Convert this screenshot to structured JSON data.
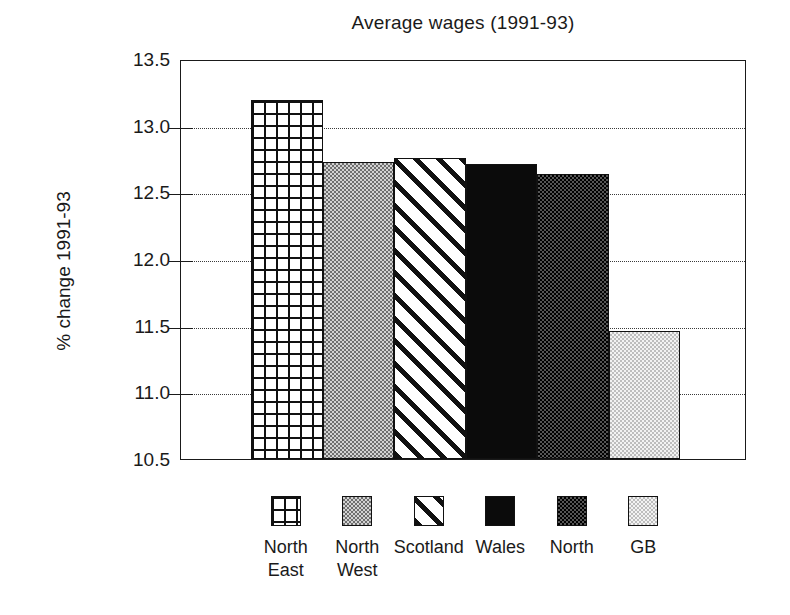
{
  "chart_data": {
    "type": "bar",
    "title": "Average wages (1991-93)",
    "xlabel": "",
    "ylabel": "% change 1991-93",
    "categories": [
      "North East",
      "North West",
      "Scotland",
      "Wales",
      "North",
      "GB"
    ],
    "category_lines": [
      [
        "North",
        "East"
      ],
      [
        "North",
        "West"
      ],
      [
        "Scotland"
      ],
      [
        "Wales"
      ],
      [
        "North"
      ],
      [
        "GB"
      ]
    ],
    "values": [
      13.19,
      12.73,
      12.76,
      12.71,
      12.64,
      11.46
    ],
    "ylim": [
      10.5,
      13.5
    ],
    "ytick_labels": [
      "13.5",
      "13.0",
      "12.5",
      "12.0",
      "11.5",
      "11.0",
      "10.5"
    ],
    "ytick_values": [
      13.5,
      13.0,
      12.5,
      12.0,
      11.5,
      11.0,
      10.5
    ],
    "grid": true,
    "grid_style": "dotted-horizontal",
    "legend_position": "bottom",
    "series_patterns": [
      "grid",
      "dots-medium",
      "diagonal-hatch",
      "solid-black",
      "dots-dark",
      "dots-light"
    ],
    "colors": {
      "axis": "#1a1a1a",
      "grid": "#3a3a3a",
      "background": "#ffffff",
      "wales_fill": "#0b0b0b",
      "north_west_fill": "#b4b4b4",
      "north_fill": "#2a2a2a",
      "gb_fill": "#e2e2e2"
    }
  }
}
